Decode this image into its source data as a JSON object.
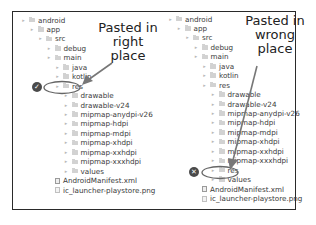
{
  "left_panel": {
    "annotation": [
      "Pasted in",
      "right",
      "place"
    ],
    "status_icon": "checkmark-icon",
    "rows": [
      {
        "label": "android",
        "depth": 0,
        "type": "folder"
      },
      {
        "label": "app",
        "depth": 1,
        "type": "folder"
      },
      {
        "label": "src",
        "depth": 2,
        "type": "folder"
      },
      {
        "label": "debug",
        "depth": 3,
        "type": "folder"
      },
      {
        "label": "main",
        "depth": 3,
        "type": "folder"
      },
      {
        "label": "java",
        "depth": 4,
        "type": "folder"
      },
      {
        "label": "kotlin",
        "depth": 4,
        "type": "folder"
      },
      {
        "label": "res",
        "depth": 4,
        "type": "folder",
        "highlighted": true
      },
      {
        "label": "drawable",
        "depth": 5,
        "type": "folder"
      },
      {
        "label": "drawable-v24",
        "depth": 5,
        "type": "folder"
      },
      {
        "label": "mipmap-anydpi-v26",
        "depth": 5,
        "type": "folder"
      },
      {
        "label": "mipmap-hdpi",
        "depth": 5,
        "type": "folder"
      },
      {
        "label": "mipmap-mdpi",
        "depth": 5,
        "type": "folder"
      },
      {
        "label": "mipmap-xhdpi",
        "depth": 5,
        "type": "folder"
      },
      {
        "label": "mipmap-xxhdpi",
        "depth": 5,
        "type": "folder"
      },
      {
        "label": "mipmap-xxxhdpi",
        "depth": 5,
        "type": "folder"
      },
      {
        "label": "values",
        "depth": 5,
        "type": "folder"
      },
      {
        "label": "AndroidManifest.xml",
        "depth": 4,
        "type": "file"
      },
      {
        "label": "ic_launcher-playstore.png",
        "depth": 4,
        "type": "image"
      }
    ]
  },
  "right_panel": {
    "annotation": [
      "Pasted in",
      "wrong",
      "place"
    ],
    "status_icon": "x-icon",
    "rows": [
      {
        "label": "android",
        "depth": 0,
        "type": "folder"
      },
      {
        "label": "app",
        "depth": 1,
        "type": "folder"
      },
      {
        "label": "src",
        "depth": 2,
        "type": "folder"
      },
      {
        "label": "debug",
        "depth": 3,
        "type": "folder"
      },
      {
        "label": "main",
        "depth": 3,
        "type": "folder"
      },
      {
        "label": "java",
        "depth": 4,
        "type": "folder"
      },
      {
        "label": "kotlin",
        "depth": 4,
        "type": "folder"
      },
      {
        "label": "res",
        "depth": 4,
        "type": "folder"
      },
      {
        "label": "drawable",
        "depth": 5,
        "type": "folder"
      },
      {
        "label": "drawable-v24",
        "depth": 5,
        "type": "folder"
      },
      {
        "label": "mipmap-anydpi-v26",
        "depth": 5,
        "type": "folder"
      },
      {
        "label": "mipmap-hdpi",
        "depth": 5,
        "type": "folder"
      },
      {
        "label": "mipmap-mdpi",
        "depth": 5,
        "type": "folder"
      },
      {
        "label": "mipmap-xhdpi",
        "depth": 5,
        "type": "folder"
      },
      {
        "label": "mipmap-xxhdpi",
        "depth": 5,
        "type": "folder"
      },
      {
        "label": "mipmap-xxxhdpi",
        "depth": 5,
        "type": "folder"
      },
      {
        "label": "res",
        "depth": 5,
        "type": "folder",
        "highlighted": true
      },
      {
        "label": "values",
        "depth": 5,
        "type": "folder"
      },
      {
        "label": "AndroidManifest.xml",
        "depth": 4,
        "type": "file"
      },
      {
        "label": "ic_launcher-playstore.png",
        "depth": 4,
        "type": "image"
      }
    ]
  },
  "colors": {
    "frame": "#2a2a2a",
    "annotation_ink": "#555555",
    "badge": "#4a4a4a",
    "tree_text": "#3a3a3a"
  }
}
